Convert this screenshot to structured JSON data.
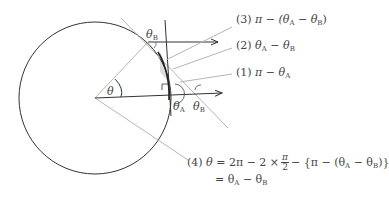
{
  "diagram": {
    "angle_labels": {
      "theta": "θ",
      "theta_A": "θ",
      "theta_A_sub": "A",
      "theta_B_top": "θ",
      "theta_B_top_sub": "B",
      "theta_B_right": "θ",
      "theta_B_right_sub": "B"
    },
    "callouts": [
      {
        "num": "(3)",
        "text": "π − (θ",
        "sub1": "A",
        "mid": " − θ",
        "sub2": "B",
        "end": ")"
      },
      {
        "num": "(2)",
        "text": "θ",
        "sub1": "A",
        "mid": " − θ",
        "sub2": "B",
        "end": ""
      },
      {
        "num": "(1)",
        "text": "π − θ",
        "sub1": "A",
        "mid": "",
        "sub2": "",
        "end": ""
      }
    ],
    "equation": {
      "num": "(4)",
      "lhs": "θ",
      "line1_a": "= 2π − 2 ×",
      "frac_num": "π",
      "frac_den": "2",
      "line1_b": "− {π − (θ",
      "sub1": "A",
      "line1_c": " − θ",
      "sub2": "B",
      "line1_d": ")}",
      "line2_a": "= θ",
      "line2_sub1": "A",
      "line2_b": " − θ",
      "line2_sub2": "B"
    },
    "colors": {
      "dark_line": "#333333",
      "gray_line": "#b0b0b0",
      "shade": "#d8d8d8"
    }
  }
}
